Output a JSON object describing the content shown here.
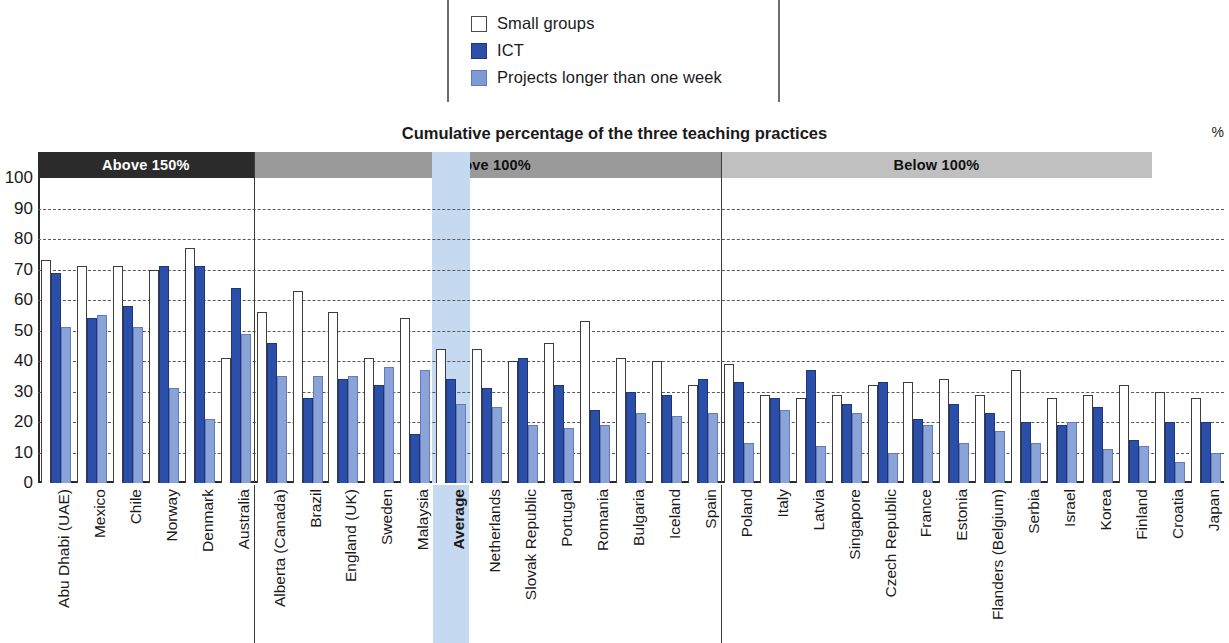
{
  "legend": {
    "items": [
      {
        "label": "Small groups",
        "swatch": "white-square-icon",
        "color": "#ffffff"
      },
      {
        "label": "ICT",
        "swatch": "dark-blue-square-icon",
        "color": "#2b4fa8"
      },
      {
        "label": "Projects longer than one week",
        "swatch": "light-blue-square-icon",
        "color": "#8aa3d8"
      }
    ]
  },
  "chart_data": {
    "type": "bar",
    "title": "Cumulative percentage of the three teaching practices",
    "xlabel": "",
    "ylabel": "%",
    "ylim": [
      0,
      100
    ],
    "yticks": [
      0,
      10,
      20,
      30,
      40,
      50,
      60,
      70,
      80,
      90,
      100
    ],
    "grid": true,
    "legend_position": "top-center",
    "y_unit_label": "%",
    "bands": [
      {
        "label": "Above 150%",
        "count": 6,
        "bg": "#2b2b2b",
        "fg": "#ffffff"
      },
      {
        "label": "Above 100%",
        "count": 13,
        "bg": "#9a9a9a",
        "fg": "#111111"
      },
      {
        "label": "Below 100%",
        "count": 12,
        "bg": "#c0c0c0",
        "fg": "#111111"
      }
    ],
    "highlight": {
      "category": "Average",
      "color": "#c5d9f0"
    },
    "categories": [
      "Abu Dhabi (UAE)",
      "Mexico",
      "Chile",
      "Norway",
      "Denmark",
      "Australia",
      "Alberta (Canada)",
      "Brazil",
      "England (UK)",
      "Sweden",
      "Malaysia",
      "Average",
      "Netherlands",
      "Slovak Republic",
      "Portugal",
      "Romania",
      "Bulgaria",
      "Iceland",
      "Spain",
      "Poland",
      "Italy",
      "Latvia",
      "Singapore",
      "Czech Republic",
      "France",
      "Estonia",
      "Flanders (Belgium)",
      "Serbia",
      "Israel",
      "Korea",
      "Finland",
      "Croatia",
      "Japan"
    ],
    "series": [
      {
        "name": "Small groups",
        "color": "#ffffff",
        "values": [
          73,
          71,
          71,
          70,
          77,
          41,
          56,
          63,
          56,
          41,
          54,
          44,
          44,
          40,
          46,
          53,
          41,
          40,
          32,
          39,
          29,
          28,
          29,
          32,
          33,
          34,
          29,
          37,
          28,
          29,
          32,
          30,
          28
        ]
      },
      {
        "name": "ICT",
        "color": "#2b4fa8",
        "values": [
          69,
          54,
          58,
          71,
          71,
          64,
          46,
          28,
          34,
          32,
          16,
          34,
          31,
          41,
          32,
          24,
          30,
          29,
          34,
          33,
          28,
          37,
          26,
          33,
          21,
          26,
          23,
          20,
          19,
          25,
          14,
          20,
          20
        ]
      },
      {
        "name": "Projects longer than one week",
        "color": "#8aa3d8",
        "values": [
          51,
          55,
          51,
          31,
          21,
          49,
          35,
          35,
          35,
          38,
          37,
          26,
          25,
          19,
          18,
          19,
          23,
          22,
          23,
          13,
          24,
          12,
          23,
          10,
          19,
          13,
          17,
          13,
          20,
          11,
          12,
          7,
          10
        ]
      }
    ]
  }
}
